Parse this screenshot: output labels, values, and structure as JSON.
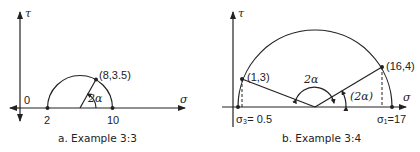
{
  "panels": [
    {
      "id": "a",
      "caption": "a.  Example 3:3",
      "axes": {
        "x_label": "σ",
        "y_label": "τ",
        "origin_label": "0"
      },
      "points": [
        {
          "label": "2"
        },
        {
          "label": "10"
        },
        {
          "label": "(8,3.5)"
        }
      ],
      "angle_label": "2α"
    },
    {
      "id": "b",
      "caption": "b.  Example 3:4",
      "axes": {
        "x_label": "σ",
        "y_label": "τ"
      },
      "points": [
        {
          "label": "σ₃= 0.5"
        },
        {
          "label": "σ₁=17"
        },
        {
          "label": "(1,3)"
        },
        {
          "label": "(16,4)"
        }
      ],
      "angle_labels": [
        "2α",
        "(2α)"
      ]
    }
  ]
}
